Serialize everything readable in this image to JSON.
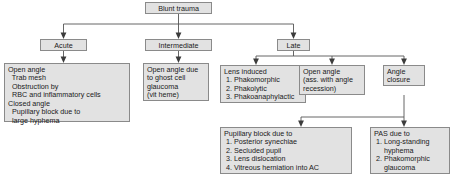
{
  "diagram": {
    "type": "flowchart",
    "colors": {
      "node_fill": "#e2e2e2",
      "node_border": "#8a8a8a",
      "connector": "#555555",
      "arrowhead": "#3c3c3c",
      "text": "#1a1a1a",
      "background": "#ffffff"
    },
    "nodes": {
      "root": {
        "id": "blunt-trauma",
        "label": "Blunt trauma"
      },
      "level1": [
        {
          "id": "acute",
          "label": "Acute"
        },
        {
          "id": "intermediate",
          "label": "Intermediate"
        },
        {
          "id": "late",
          "label": "Late"
        }
      ],
      "acute_detail": {
        "id": "acute-detail",
        "label": "Open angle\n  Trab mesh\n  Obstruction by\n  RBC and inflammatory cells\nClosed angle\n  Pupillary block due to\n  large hyphema"
      },
      "intermediate_detail": {
        "id": "intermediate-detail",
        "label": "Open angle due\nto ghost cell\nglaucoma\n(vit heme)"
      },
      "late_children": [
        {
          "id": "lens-induced",
          "label": "Lens induced\n 1. Phakomorphic\n 2. Phakolytic\n 3. Phakoanaphylactic"
        },
        {
          "id": "open-angle-recession",
          "label": "Open angle\n(ass. with angle\nrecession)"
        },
        {
          "id": "angle-closure",
          "label": "Angle\nclosure"
        }
      ],
      "angle_closure_children": [
        {
          "id": "pupillary-block",
          "label": "Pupillary block due to\n 1. Posterior synechiae\n 2. Secluded pupil\n 3. Lens dislocation\n 4. Vitreous herniation into AC"
        },
        {
          "id": "pas",
          "label": "PAS due to\n 1. Long-standing\n     hyphema\n 2. Phakomorphic\n     glaucoma"
        }
      ]
    }
  }
}
